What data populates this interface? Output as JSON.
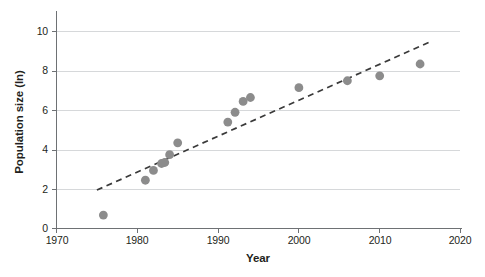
{
  "chart_data": {
    "type": "scatter",
    "title": "",
    "xlabel": "Year",
    "ylabel": "Population size (ln)",
    "xlim": [
      1970,
      2020
    ],
    "ylim": [
      0,
      10
    ],
    "xticks": [
      1970,
      1980,
      1990,
      2000,
      2010,
      2020
    ],
    "yticks": [
      0,
      2,
      4,
      6,
      8,
      10
    ],
    "grid": "horizontal",
    "legend": "none",
    "series": [
      {
        "name": "Population size (ln)",
        "marker": "filled-circle",
        "color": "#8c8c8c",
        "points": [
          {
            "x": 1975.8,
            "y": 0.68
          },
          {
            "x": 1981.0,
            "y": 2.45
          },
          {
            "x": 1982.0,
            "y": 2.95
          },
          {
            "x": 1983.0,
            "y": 3.3
          },
          {
            "x": 1983.4,
            "y": 3.35
          },
          {
            "x": 1984.0,
            "y": 3.75
          },
          {
            "x": 1985.0,
            "y": 4.35
          },
          {
            "x": 1991.2,
            "y": 5.4
          },
          {
            "x": 1992.1,
            "y": 5.9
          },
          {
            "x": 1993.1,
            "y": 6.45
          },
          {
            "x": 1994.0,
            "y": 6.65
          },
          {
            "x": 2000.0,
            "y": 7.15
          },
          {
            "x": 2006.0,
            "y": 7.5
          },
          {
            "x": 2010.0,
            "y": 7.75
          },
          {
            "x": 2015.0,
            "y": 8.35
          }
        ]
      }
    ],
    "trendline": {
      "name": "linear trend",
      "style": "dashed",
      "color": "#3a3a3a",
      "x_start": 1975.0,
      "y_start": 1.95,
      "x_end": 2016.1,
      "y_end": 9.45
    },
    "xtick_labels": [
      "1970",
      "1980",
      "1990",
      "2000",
      "2010",
      "2020"
    ],
    "ytick_labels": [
      "0",
      "2",
      "4",
      "6",
      "8",
      "10"
    ]
  },
  "axes": {
    "y_title": "Population size (ln)",
    "x_title": "Year"
  }
}
